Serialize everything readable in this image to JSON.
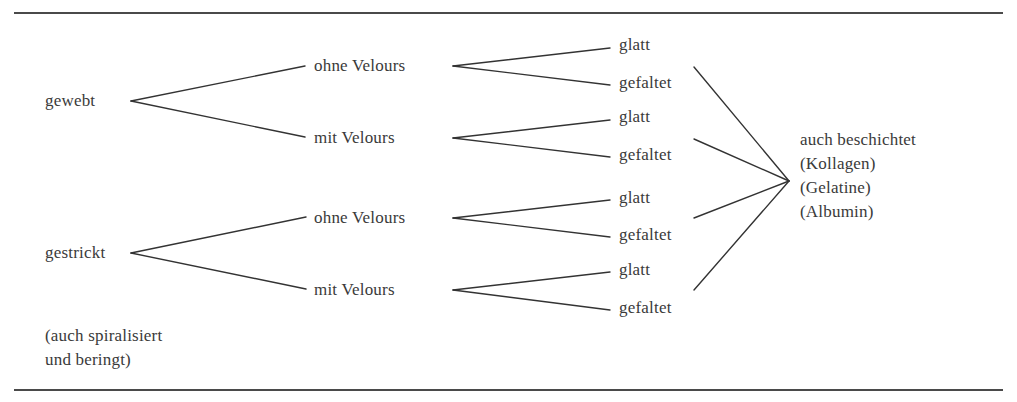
{
  "diagram": {
    "root_nodes": [
      {
        "label": "gewebt",
        "children": [
          {
            "label": "ohne Velours",
            "children": [
              {
                "label": "glatt"
              },
              {
                "label": "gefaltet"
              }
            ]
          },
          {
            "label": "mit Velours",
            "children": [
              {
                "label": "glatt"
              },
              {
                "label": "gefaltet"
              }
            ]
          }
        ]
      },
      {
        "label": "gestrickt",
        "children": [
          {
            "label": "ohne Velours",
            "children": [
              {
                "label": "glatt"
              },
              {
                "label": "gefaltet"
              }
            ]
          },
          {
            "label": "mit Velours",
            "children": [
              {
                "label": "glatt"
              },
              {
                "label": "gefaltet"
              }
            ]
          }
        ]
      }
    ],
    "note": {
      "line1": "(auch spiralisiert",
      "line2": "und beringt)"
    },
    "coating": {
      "line1": "auch beschichtet",
      "line2": "(Kollagen)",
      "line3": "(Gelatine)",
      "line4": "(Albumin)"
    },
    "line_color": "#3a3a3a",
    "text_color": "#3a3a3a"
  }
}
